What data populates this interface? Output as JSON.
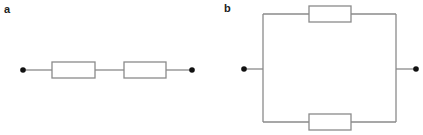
{
  "panels": [
    {
      "label": "a",
      "type": "series-circuit",
      "resistor_count": 2
    },
    {
      "label": "b",
      "type": "parallel-circuit",
      "resistor_count": 2
    }
  ],
  "colors": {
    "wire": "#8a8a8a",
    "terminal": "#111111",
    "resistor_stroke": "#8a8a8a",
    "label": "#222222"
  }
}
